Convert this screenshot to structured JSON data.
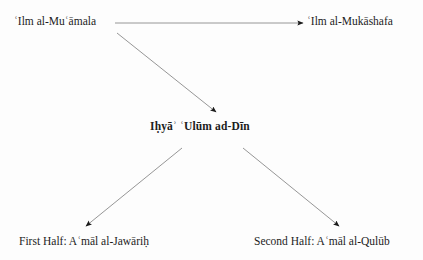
{
  "diagram": {
    "background_color": "#fdfdfd",
    "text_color": "#1c1c1c",
    "line_color": "#8a8a8a",
    "arrowhead_color": "#1a1a1a",
    "nodes": {
      "muamala": {
        "label": "ʿIlm al-Muʿāmala"
      },
      "mukashafa": {
        "label": "ʿIlm al-Mukāshafa"
      },
      "ihya": {
        "label": "Iḥyāʾ ʿUlūm ad-Dīn"
      },
      "first_half": {
        "label": "First Half: Aʿmāl al-Jawāriḥ"
      },
      "second_half": {
        "label": "Second Half: Aʿmāl al-Qulūb"
      }
    },
    "edges": [
      {
        "name": "muamala-to-mukashafa",
        "from": "muamala",
        "to": "mukashafa",
        "x1": 115,
        "y1": 23,
        "x2": 303,
        "y2": 23
      },
      {
        "name": "muamala-to-ihya",
        "from": "muamala",
        "to": "ihya",
        "x1": 117,
        "y1": 33,
        "x2": 216,
        "y2": 112
      },
      {
        "name": "ihya-to-first-half",
        "from": "ihya",
        "to": "first_half",
        "x1": 182,
        "y1": 148,
        "x2": 86,
        "y2": 226
      },
      {
        "name": "ihya-to-second-half",
        "from": "ihya",
        "to": "second_half",
        "x1": 243,
        "y1": 148,
        "x2": 339,
        "y2": 226
      }
    ]
  }
}
